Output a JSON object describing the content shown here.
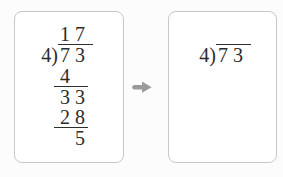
{
  "left_card": {
    "role": "worked example of long division",
    "quotient": "17",
    "divisor": "4",
    "bracket": ")",
    "dividend": "73",
    "steps": [
      "4",
      "33",
      "28",
      "5"
    ]
  },
  "right_card": {
    "role": "blank practice problem",
    "divisor": "4",
    "bracket": ")",
    "dividend": "73"
  },
  "arrow": {
    "icon": "right-arrow",
    "color": "#9a9a9a"
  },
  "colors": {
    "text": "#2b2b2b",
    "work_lines": "#2e2e2e",
    "card_border": "#c7c7c7",
    "card_background": "#ffffff",
    "page_background": "#fcfcfc"
  }
}
